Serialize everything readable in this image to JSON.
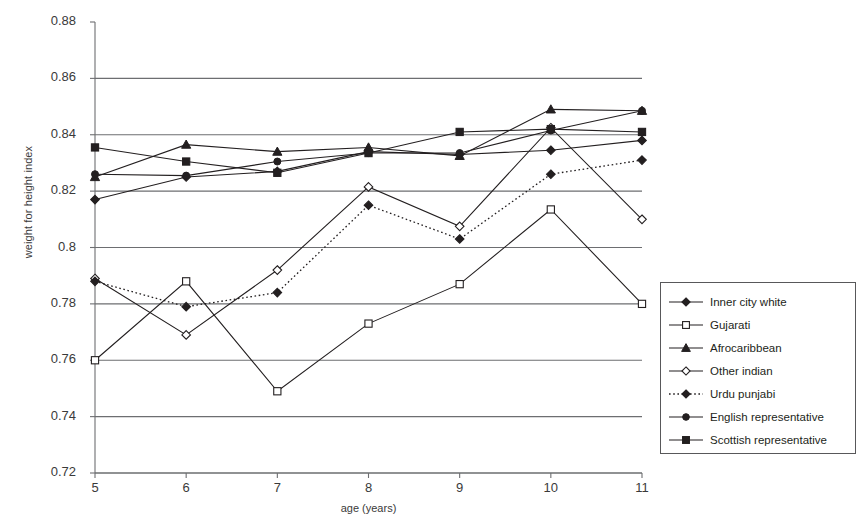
{
  "chart_data": {
    "type": "line",
    "title": "",
    "xlabel": "age (years)",
    "ylabel": "weight for height index",
    "x": [
      5,
      6,
      7,
      8,
      9,
      10,
      11
    ],
    "xtick_labels": [
      "5",
      "6",
      "7",
      "8",
      "9",
      "10",
      "11"
    ],
    "ytick_labels": [
      "0.72",
      "0.74",
      "0.76",
      "0.78",
      "0.8",
      "0.82",
      "0.84",
      "0.86",
      "0.88"
    ],
    "ytick_values": [
      0.72,
      0.74,
      0.76,
      0.78,
      0.8,
      0.82,
      0.84,
      0.86,
      0.88
    ],
    "ylim": [
      0.72,
      0.88
    ],
    "xlim": [
      5,
      11
    ],
    "grid": "horizontal",
    "legend_position": "right-lower",
    "series": [
      {
        "name": "Inner city white",
        "marker": "filled-diamond",
        "line": "solid",
        "values": [
          0.817,
          0.825,
          0.827,
          0.834,
          0.833,
          0.8345,
          0.838
        ]
      },
      {
        "name": "Gujarati",
        "marker": "open-square",
        "line": "solid",
        "values": [
          0.76,
          0.788,
          0.749,
          0.773,
          0.787,
          0.8135,
          0.78
        ]
      },
      {
        "name": "Afrocaribbean",
        "marker": "filled-triangle",
        "line": "solid",
        "values": [
          0.825,
          0.8365,
          0.834,
          0.8355,
          0.8325,
          0.849,
          0.8485
        ]
      },
      {
        "name": "Other indian",
        "marker": "open-diamond",
        "line": "solid",
        "values": [
          0.789,
          0.769,
          0.792,
          0.8215,
          0.8075,
          0.8425,
          0.81
        ]
      },
      {
        "name": "Urdu punjabi",
        "marker": "filled-diamond",
        "line": "dotted",
        "values": [
          0.788,
          0.779,
          0.784,
          0.815,
          0.803,
          0.826,
          0.831
        ]
      },
      {
        "name": "English representative",
        "marker": "filled-circle",
        "line": "solid",
        "values": [
          0.826,
          0.8255,
          0.8305,
          0.8335,
          0.8335,
          0.8415,
          0.8485
        ]
      },
      {
        "name": "Scottish representative",
        "marker": "filled-square",
        "line": "solid",
        "values": [
          0.8355,
          0.8305,
          0.8265,
          0.8335,
          0.841,
          0.842,
          0.841
        ]
      }
    ]
  },
  "colors": {
    "line": "#231f20",
    "grid": "#6d6e71",
    "axis": "#6d6e71",
    "text": "#3a3a3a",
    "background": "#ffffff"
  }
}
